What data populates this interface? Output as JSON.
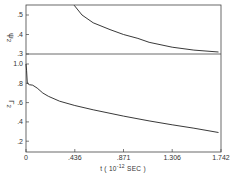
{
  "chart_data": [
    {
      "type": "line",
      "panel": "top",
      "ylabel": "ψ2",
      "xlabel": "",
      "ylim": [
        0.3,
        0.55
      ],
      "xlim": [
        0,
        1.742
      ],
      "yticks": [
        0.3,
        0.4,
        0.5
      ],
      "ytick_labels": [
        ".3",
        ".4",
        ".5"
      ],
      "x": [
        0.43,
        0.5,
        0.6,
        0.75,
        0.871,
        1.0,
        1.1,
        1.306,
        1.5,
        1.72
      ],
      "y": [
        0.55,
        0.5,
        0.46,
        0.425,
        0.4,
        0.38,
        0.36,
        0.335,
        0.32,
        0.31
      ]
    },
    {
      "type": "line",
      "panel": "bottom",
      "ylabel": "Γ2",
      "xlabel": "t (10^-12 SEC)",
      "ylim": [
        0.15,
        1.02
      ],
      "xlim": [
        0,
        1.742
      ],
      "yticks": [
        0.2,
        0.4,
        0.6,
        0.8,
        1.0
      ],
      "ytick_labels": [
        ".2",
        ".4",
        ".6",
        ".8",
        "1.0"
      ],
      "xticks": [
        0,
        0.436,
        0.871,
        1.306,
        1.742
      ],
      "xtick_labels": [
        "0",
        ".436",
        ".871",
        "1.306",
        "1.742"
      ],
      "x": [
        0,
        0.005,
        0.012,
        0.03,
        0.06,
        0.1,
        0.15,
        0.2,
        0.3,
        0.436,
        0.6,
        0.871,
        1.1,
        1.306,
        1.5,
        1.72
      ],
      "y": [
        1.0,
        0.93,
        0.8,
        0.785,
        0.78,
        0.75,
        0.7,
        0.665,
        0.615,
        0.57,
        0.525,
        0.46,
        0.41,
        0.37,
        0.335,
        0.29
      ]
    }
  ],
  "labels": {
    "top_ylabel": "ψ",
    "top_ylabel_sub": "2",
    "bottom_ylabel": "Γ",
    "bottom_ylabel_sub": "2",
    "xlabel_prefix": "t ( 10",
    "xlabel_exp": "-12",
    "xlabel_suffix": " SEC )"
  }
}
